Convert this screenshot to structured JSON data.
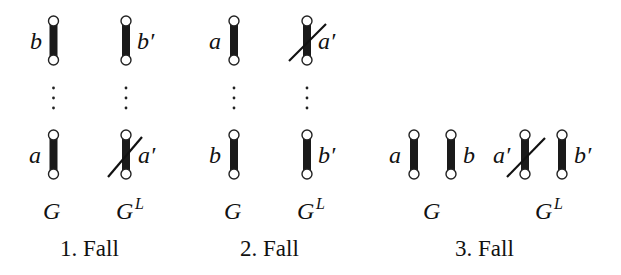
{
  "figure": {
    "cases": [
      {
        "caption": "1. Fall",
        "graph_label": "G",
        "graph_l_label": "G",
        "graph_l_sup": "L",
        "G_top_edge": "b",
        "G_bottom_edge": "a",
        "GL_top_edge": "b′",
        "GL_bottom_edge": "a′",
        "GL_crossed": "a′"
      },
      {
        "caption": "2. Fall",
        "graph_label": "G",
        "graph_l_label": "G",
        "graph_l_sup": "L",
        "G_top_edge": "a",
        "G_bottom_edge": "b",
        "GL_top_edge": "a′",
        "GL_bottom_edge": "b′",
        "GL_crossed": "a′"
      },
      {
        "caption": "3. Fall",
        "graph_label": "G",
        "graph_l_label": "G",
        "graph_l_sup": "L",
        "G_edges": [
          "a",
          "b"
        ],
        "GL_edges": [
          "a′",
          "b′"
        ],
        "GL_crossed": "a′"
      }
    ],
    "ellipsis": "⋮"
  }
}
